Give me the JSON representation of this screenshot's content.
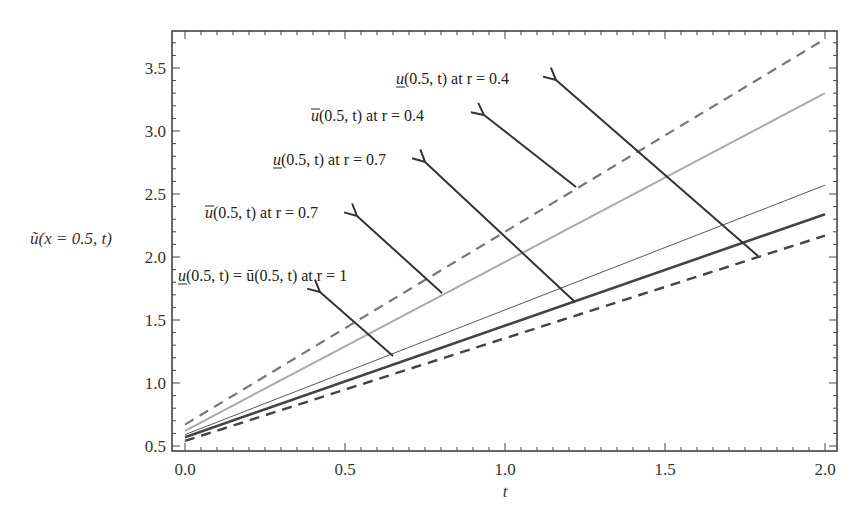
{
  "chart_data": {
    "type": "line",
    "title": "",
    "xlabel": "t",
    "ylabel": "ũ(x = 0.5, t)",
    "xlim": [
      0.0,
      2.0
    ],
    "ylim": [
      0.5,
      3.75
    ],
    "grid": false,
    "x_ticks": [
      "0.0",
      "0.5",
      "1.0",
      "1.5",
      "2.0"
    ],
    "y_ticks": [
      "0.5",
      "1.0",
      "1.5",
      "2.0",
      "2.5",
      "3.0",
      "3.5"
    ],
    "x": [
      0.0,
      2.0
    ],
    "series": [
      {
        "name": "u_lower(0.5,t) at r=0.4",
        "values": [
          0.67,
          3.73
        ],
        "style": "dashed",
        "color": "#777777",
        "width": 2.2
      },
      {
        "name": "u_upper(0.5,t) at r=0.4",
        "values": [
          0.62,
          3.3
        ],
        "style": "solid",
        "color": "#aaaaaa",
        "width": 2
      },
      {
        "name": "u_upper(0.5,t) at r=0.7",
        "values": [
          0.59,
          2.57
        ],
        "style": "solid",
        "color": "#444444",
        "width": 0.9
      },
      {
        "name": "u_lower(0.5,t) = u_upper(0.5,t) at r=1",
        "values": [
          0.57,
          2.34
        ],
        "style": "solid",
        "color": "#444444",
        "width": 2.6
      },
      {
        "name": "u_lower(0.5,t) at r=0.7",
        "values": [
          0.54,
          2.17
        ],
        "style": "dashed",
        "color": "#444444",
        "width": 2.4
      }
    ],
    "annotations": [
      {
        "id": "a1",
        "prefix": "u",
        "accent": "under",
        "text": "(0.5, t) at r = 0.4",
        "label_x": 396,
        "label_y": 84,
        "head": [
          556,
          80
        ],
        "tail": [
          758,
          256
        ]
      },
      {
        "id": "a2",
        "prefix": "u",
        "accent": "over",
        "text": "(0.5, t) at r = 0.4",
        "label_x": 311,
        "label_y": 121,
        "head": [
          484,
          115
        ],
        "tail": [
          576,
          187
        ]
      },
      {
        "id": "a3",
        "prefix": "u",
        "accent": "under",
        "text": "(0.5, t) at r = 0.7",
        "label_x": 273,
        "label_y": 165,
        "head": [
          425,
          162
        ],
        "tail": [
          575,
          302
        ]
      },
      {
        "id": "a4",
        "prefix": "u",
        "accent": "over",
        "text": "(0.5, t) at r = 0.7",
        "label_x": 205,
        "label_y": 218,
        "head": [
          357,
          216
        ],
        "tail": [
          442,
          293
        ]
      },
      {
        "id": "a5",
        "prefix": "u",
        "accent": "under",
        "text": "(0.5, t) = ū(0.5, t) at r = 1",
        "label_x": 178,
        "label_y": 281,
        "head": [
          320,
          292
        ],
        "tail": [
          393,
          356
        ]
      }
    ],
    "colors": {
      "frame": "#444444",
      "arrow": "#333333",
      "text": "#222222"
    }
  }
}
